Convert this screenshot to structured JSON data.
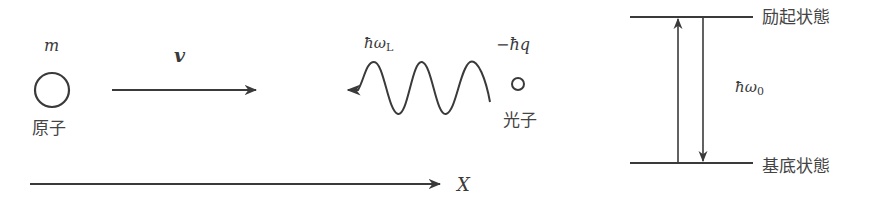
{
  "diagram": {
    "atom": {
      "mass_label": "m",
      "name_label": "原子"
    },
    "velocity": {
      "label": "v"
    },
    "photon": {
      "energy_label_main": "ħω",
      "energy_label_sub": "L",
      "momentum_label": "−ħq",
      "name_label": "光子"
    },
    "axis": {
      "label": "X"
    },
    "energy_levels": {
      "excited_label": "励起状態",
      "ground_label": "基底状態",
      "gap_label_main": "ħω",
      "gap_label_sub": "0"
    },
    "colors": {
      "stroke": "#3a3a3a",
      "background": "#ffffff"
    }
  }
}
